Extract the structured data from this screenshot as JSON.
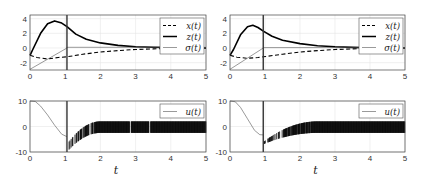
{
  "chart_data": [
    {
      "type": "line",
      "panel": "top-left",
      "title": "",
      "xlabel": "",
      "ylabel": "",
      "xlim": [
        0,
        5
      ],
      "ylim": [
        -3,
        4.5
      ],
      "xticks": [
        "0",
        "1",
        "2",
        "3",
        "4",
        "5"
      ],
      "yticks": [
        "-2",
        "0",
        "2",
        "4"
      ],
      "grid": true,
      "legend_position": "upper right",
      "vertical_marker_t": 1.05,
      "series": [
        {
          "name": "x(t)",
          "label": "x(t)",
          "style": "dashed",
          "x": [
            0,
            0.2,
            0.5,
            0.8,
            1.05,
            1.5,
            2,
            2.5,
            3,
            3.5,
            4,
            4.5,
            5
          ],
          "y": [
            -1,
            -1.3,
            -1.5,
            -1.3,
            -1.2,
            -0.85,
            -0.55,
            -0.35,
            -0.2,
            -0.12,
            -0.06,
            -0.03,
            0
          ]
        },
        {
          "name": "z(t)",
          "label": "z(t)",
          "style": "solid-thick",
          "x": [
            0,
            0.1,
            0.3,
            0.5,
            0.7,
            0.9,
            1.05,
            1.3,
            1.6,
            2,
            2.5,
            3,
            3.5,
            4,
            4.5,
            5
          ],
          "y": [
            -1,
            0,
            2,
            3.3,
            3.7,
            3.4,
            2.9,
            1.9,
            1.2,
            0.7,
            0.35,
            0.18,
            0.09,
            0.05,
            0.02,
            0
          ]
        },
        {
          "name": "sigma(t)",
          "label": "σ(t)",
          "style": "solid-thin",
          "x": [
            0,
            1.05,
            1.05,
            5
          ],
          "y": [
            -2.9,
            0,
            0.1,
            0.1
          ]
        }
      ]
    },
    {
      "type": "line",
      "panel": "top-right",
      "title": "",
      "xlabel": "",
      "ylabel": "",
      "xlim": [
        0,
        5
      ],
      "ylim": [
        -3,
        4.5
      ],
      "xticks": [
        "0",
        "1",
        "2",
        "3",
        "4",
        "5"
      ],
      "yticks": [
        "-2",
        "0",
        "2",
        "4"
      ],
      "grid": true,
      "legend_position": "upper right",
      "vertical_marker_t": 0.95,
      "series": [
        {
          "name": "x(t)",
          "label": "x(t)",
          "style": "dashed",
          "x": [
            0,
            0.2,
            0.5,
            0.8,
            0.95,
            1.5,
            2,
            2.5,
            3,
            3.5,
            4,
            4.5,
            5
          ],
          "y": [
            -1,
            -1.25,
            -1.4,
            -1.3,
            -1.2,
            -0.85,
            -0.55,
            -0.35,
            -0.2,
            -0.12,
            -0.06,
            -0.03,
            0
          ]
        },
        {
          "name": "z(t)",
          "label": "z(t)",
          "style": "solid-thick",
          "x": [
            0,
            0.1,
            0.3,
            0.5,
            0.65,
            0.8,
            0.95,
            1.2,
            1.5,
            2,
            2.5,
            3,
            3.5,
            4,
            4.5,
            5
          ],
          "y": [
            -1,
            -0.2,
            1.8,
            2.9,
            3.1,
            2.8,
            2.3,
            1.6,
            1.05,
            0.6,
            0.32,
            0.16,
            0.08,
            0.04,
            0.02,
            0
          ]
        },
        {
          "name": "sigma(t)",
          "label": "σ(t)",
          "style": "solid-thin",
          "x": [
            0,
            0.95,
            0.95,
            5
          ],
          "y": [
            -2.9,
            0,
            0.05,
            0.05
          ]
        }
      ]
    },
    {
      "type": "line",
      "panel": "bottom-left",
      "title": "",
      "xlabel": "t",
      "ylabel": "",
      "xlim": [
        0,
        5
      ],
      "ylim": [
        -10,
        10
      ],
      "xticks": [
        "0",
        "1",
        "2",
        "3",
        "4",
        "5"
      ],
      "yticks": [
        "-10",
        "0",
        "10"
      ],
      "grid": true,
      "legend_position": "upper right",
      "vertical_marker_t": 1.05,
      "series": [
        {
          "name": "u(t)",
          "label": "u(t)",
          "style": "solid-thin",
          "x": [
            0,
            0.15,
            0.3,
            0.5,
            0.7,
            0.9,
            1.05
          ],
          "y": [
            10,
            9.8,
            8,
            4.5,
            0.5,
            -3,
            -4
          ]
        }
      ],
      "chattering_band": {
        "t_start": 1.05,
        "t_full": 2.0,
        "y_high_end": 2,
        "y_low_end": -2.5,
        "y_start": -10,
        "gaps_t": [
          2.85,
          3.4
        ]
      }
    },
    {
      "type": "line",
      "panel": "bottom-right",
      "title": "",
      "xlabel": "t",
      "ylabel": "",
      "xlim": [
        0,
        5
      ],
      "ylim": [
        -10,
        10
      ],
      "xticks": [
        "0",
        "1",
        "2",
        "3",
        "4",
        "5"
      ],
      "yticks": [
        "-10",
        "0",
        "10"
      ],
      "grid": true,
      "legend_position": "upper right",
      "vertical_marker_t": 0.95,
      "series": [
        {
          "name": "u(t)",
          "label": "u(t)",
          "style": "solid-thin",
          "x": [
            0,
            0.15,
            0.3,
            0.5,
            0.7,
            0.85,
            0.95
          ],
          "y": [
            10,
            9.7,
            7.5,
            3,
            -1.5,
            -3.2,
            -3.3
          ]
        }
      ],
      "chattering_band": {
        "t_start": 0.95,
        "t_full": 2.5,
        "y_high_end": 2,
        "y_low_end": -2.5,
        "y_start": -7,
        "gaps_t": []
      }
    }
  ]
}
